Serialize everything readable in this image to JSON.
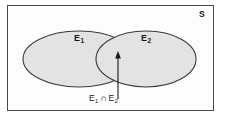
{
  "figure": {
    "kind": "venn-diagram",
    "universe_label": "S",
    "sets": [
      {
        "name": "E1",
        "label_base": "E",
        "label_sub": "1"
      },
      {
        "name": "E2",
        "label_base": "E",
        "label_sub": "2"
      }
    ],
    "caption": {
      "full_text": "E1 ∩ E2",
      "left_base": "E",
      "left_sub": "1",
      "operator": "∩",
      "right_base": "E",
      "right_sub": "2"
    },
    "annotation": {
      "arrow": "up-arrow",
      "points_to": "intersection-region"
    },
    "colors": {
      "frame_border": "#4a4a4a",
      "frame_fill": "#fdfdfd",
      "ellipse_fill": "#e3e3e3",
      "ellipse_stroke": "#3a3a3a",
      "text": "#161616",
      "page_background": "#ffffff"
    }
  }
}
